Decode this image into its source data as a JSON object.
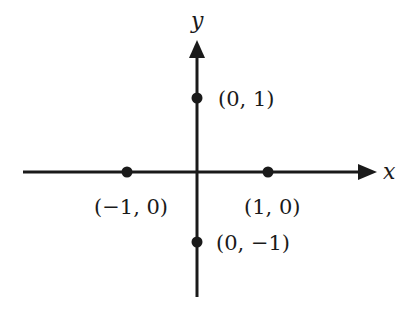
{
  "diagram": {
    "type": "coordinate-plane",
    "axes": {
      "x_label": "x",
      "y_label": "y",
      "color": "#1a1a1a"
    },
    "points": [
      {
        "coords": [
          0,
          1
        ],
        "label": "(0, 1)"
      },
      {
        "coords": [
          -1,
          0
        ],
        "label": "(−1, 0)"
      },
      {
        "coords": [
          1,
          0
        ],
        "label": "(1, 0)"
      },
      {
        "coords": [
          0,
          -1
        ],
        "label": "(0, −1)"
      }
    ]
  }
}
